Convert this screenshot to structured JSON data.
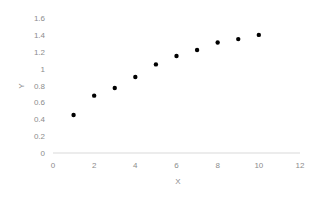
{
  "chart_data": {
    "type": "scatter",
    "title": "",
    "xlabel": "X",
    "ylabel": "Y",
    "xlim": [
      0,
      12
    ],
    "ylim": [
      0,
      1.6
    ],
    "x_ticks": [
      "0",
      "2",
      "4",
      "6",
      "8",
      "10",
      "12"
    ],
    "y_ticks": [
      "0",
      "0.2",
      "0.4",
      "0.6",
      "0.8",
      "1",
      "1.2",
      "1.4",
      "1.6"
    ],
    "grid": false,
    "legend": null,
    "series": [
      {
        "name": "Y",
        "color": "#000000",
        "x": [
          1,
          2,
          3,
          4,
          5,
          6,
          7,
          8,
          9,
          10
        ],
        "y": [
          0.45,
          0.68,
          0.77,
          0.9,
          1.05,
          1.15,
          1.22,
          1.31,
          1.35,
          1.4
        ]
      }
    ]
  }
}
